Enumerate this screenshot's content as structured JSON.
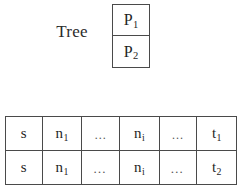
{
  "figure": {
    "name": "tree-path-sequence-diagram",
    "background_color": "#ffffff",
    "line_color": "#4a4a4a",
    "text_color": "#1f1f1f"
  },
  "tree": {
    "label": "Tree",
    "box": {
      "cells": [
        {
          "base": "P",
          "subscript": "1"
        },
        {
          "base": "P",
          "subscript": "2"
        }
      ]
    }
  },
  "sequence_table": {
    "rows": [
      {
        "id": "path-1",
        "cells": [
          {
            "base": "s",
            "subscript": ""
          },
          {
            "base": "n",
            "subscript": "1"
          },
          {
            "base": "…",
            "subscript": ""
          },
          {
            "base": "n",
            "subscript": "i"
          },
          {
            "base": "…",
            "subscript": ""
          },
          {
            "base": "t",
            "subscript": "1"
          }
        ]
      },
      {
        "id": "path-2",
        "cells": [
          {
            "base": "s",
            "subscript": ""
          },
          {
            "base": "n",
            "subscript": "1"
          },
          {
            "base": "…",
            "subscript": ""
          },
          {
            "base": "n",
            "subscript": "i"
          },
          {
            "base": "…",
            "subscript": ""
          },
          {
            "base": "t",
            "subscript": "2"
          }
        ]
      }
    ]
  }
}
